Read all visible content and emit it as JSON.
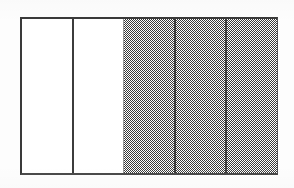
{
  "figure": {
    "kind": "area-model-fraction-bar",
    "total_parts": 5,
    "shaded_parts": 3,
    "unshaded_parts": 2,
    "fraction_shaded": "3/5",
    "orientation": "vertical-columns",
    "border_color": "#3a3a3a",
    "shaded_fill_color": "#3b3b3b",
    "unshaded_fill_color": "#ffffff",
    "page_background_color": "#fdfdfd",
    "columns": [
      {
        "index": 1,
        "state": "unshaded",
        "label": ""
      },
      {
        "index": 2,
        "state": "unshaded",
        "label": ""
      },
      {
        "index": 3,
        "state": "shaded",
        "label": ""
      },
      {
        "index": 4,
        "state": "shaded",
        "label": ""
      },
      {
        "index": 5,
        "state": "shaded",
        "label": ""
      }
    ]
  },
  "chart_data": {
    "type": "bar",
    "title": "",
    "subtitle": "",
    "xlabel": "",
    "ylabel": "",
    "categories": [
      "1",
      "2",
      "3",
      "4",
      "5"
    ],
    "values": [
      1,
      1,
      1,
      1,
      1
    ],
    "series": [
      {
        "name": "shaded",
        "values": [
          0,
          0,
          1,
          1,
          1
        ]
      }
    ],
    "legend": [],
    "legend_position": "none",
    "grid": false,
    "annotations": []
  }
}
